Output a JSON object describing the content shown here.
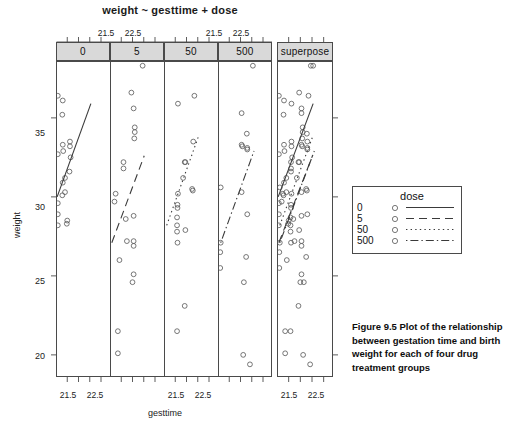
{
  "figure": {
    "title": "weight ~ gesttime + dose",
    "caption_label": "Figure 9.5",
    "caption_text": "Plot of the relationship between gestation time and birth weight for each of four drug treatment groups",
    "caption_full": "Figure 9.5   Plot of the relationship between gestation time and birth weight for each of four drug treatment groups"
  },
  "axes": {
    "x_label": "gesttime",
    "y_label": "weight",
    "x_tick_labels": [
      "21.5",
      "22.5"
    ],
    "y_tick_labels": [
      "35",
      "30",
      "25",
      "20"
    ],
    "x_ticks": [
      21.5,
      22.5
    ],
    "y_ticks": [
      20,
      25,
      30,
      35
    ],
    "xlim": [
      21.0,
      23.4
    ],
    "ylim": [
      18.6,
      38.6
    ]
  },
  "strips": {
    "panel_labels": [
      "0",
      "5",
      "50",
      "500"
    ],
    "superpose_label": "superpose"
  },
  "legend": {
    "title": "dose",
    "entries": [
      {
        "label": "0",
        "line_style": "solid",
        "symbol": "open-circle"
      },
      {
        "label": "5",
        "line_style": "dashed",
        "symbol": "open-circle"
      },
      {
        "label": "50",
        "line_style": "dotted",
        "symbol": "open-circle"
      },
      {
        "label": "500",
        "line_style": "dashdot",
        "symbol": "open-circle"
      }
    ]
  },
  "colors": {
    "point_stroke": "#555555",
    "line_stroke": "#3a3a3a",
    "frame": "#4a4a4a",
    "strip_fill": "#d9d9d9",
    "background": "#ffffff"
  },
  "chart_data": {
    "type": "scatter",
    "title": "weight ~ gesttime + dose",
    "xlabel": "gesttime",
    "ylabel": "weight",
    "xlim": [
      21.0,
      23.4
    ],
    "ylim": [
      18.6,
      38.6
    ],
    "grid": false,
    "legend_position": "right",
    "conditioning_variable": "dose",
    "panels": [
      "0",
      "5",
      "50",
      "500",
      "superpose"
    ],
    "series": [
      {
        "name": "0",
        "line_style": "solid",
        "fit_line": {
          "x0": 21.05,
          "y0": 30.0,
          "x1": 22.55,
          "y1": 35.9
        },
        "points": [
          {
            "x": 21.08,
            "y": 36.4
          },
          {
            "x": 21.3,
            "y": 36.1
          },
          {
            "x": 21.28,
            "y": 35.2
          },
          {
            "x": 21.3,
            "y": 33.3
          },
          {
            "x": 21.32,
            "y": 32.9
          },
          {
            "x": 21.08,
            "y": 32.7
          },
          {
            "x": 21.62,
            "y": 33.5
          },
          {
            "x": 21.62,
            "y": 33.2
          },
          {
            "x": 21.65,
            "y": 32.5
          },
          {
            "x": 21.6,
            "y": 31.6
          },
          {
            "x": 21.4,
            "y": 31.2
          },
          {
            "x": 21.3,
            "y": 30.9
          },
          {
            "x": 21.28,
            "y": 30.1
          },
          {
            "x": 21.4,
            "y": 30.3
          },
          {
            "x": 21.08,
            "y": 29.6
          },
          {
            "x": 21.08,
            "y": 28.9
          },
          {
            "x": 21.08,
            "y": 28.2
          },
          {
            "x": 21.5,
            "y": 28.5
          },
          {
            "x": 21.48,
            "y": 28.3
          }
        ]
      },
      {
        "name": "5",
        "line_style": "dashed",
        "fit_line": {
          "x0": 21.08,
          "y0": 27.1,
          "x1": 22.52,
          "y1": 32.6
        },
        "points": [
          {
            "x": 22.45,
            "y": 38.3
          },
          {
            "x": 21.95,
            "y": 36.6
          },
          {
            "x": 22.05,
            "y": 35.6
          },
          {
            "x": 22.1,
            "y": 34.4
          },
          {
            "x": 22.1,
            "y": 34.1
          },
          {
            "x": 22.08,
            "y": 33.7
          },
          {
            "x": 21.6,
            "y": 32.2
          },
          {
            "x": 21.6,
            "y": 31.8
          },
          {
            "x": 21.25,
            "y": 30.2
          },
          {
            "x": 21.2,
            "y": 29.7
          },
          {
            "x": 21.7,
            "y": 28.6
          },
          {
            "x": 22.05,
            "y": 28.8
          },
          {
            "x": 21.75,
            "y": 27.2
          },
          {
            "x": 22.05,
            "y": 27.2
          },
          {
            "x": 22.05,
            "y": 26.9
          },
          {
            "x": 21.42,
            "y": 26.0
          },
          {
            "x": 22.05,
            "y": 25.1
          },
          {
            "x": 22.0,
            "y": 24.6
          },
          {
            "x": 21.35,
            "y": 21.5
          },
          {
            "x": 21.35,
            "y": 20.1
          }
        ]
      },
      {
        "name": "50",
        "line_style": "dotted",
        "fit_line": {
          "x0": 21.12,
          "y0": 28.2,
          "x1": 22.55,
          "y1": 33.9
        },
        "points": [
          {
            "x": 22.35,
            "y": 36.4
          },
          {
            "x": 21.62,
            "y": 35.9
          },
          {
            "x": 22.3,
            "y": 33.5
          },
          {
            "x": 21.95,
            "y": 32.2
          },
          {
            "x": 21.92,
            "y": 32.2
          },
          {
            "x": 22.25,
            "y": 30.5
          },
          {
            "x": 22.28,
            "y": 30.4
          },
          {
            "x": 21.85,
            "y": 31.2
          },
          {
            "x": 21.62,
            "y": 30.2
          },
          {
            "x": 21.6,
            "y": 29.5
          },
          {
            "x": 21.6,
            "y": 29.3
          },
          {
            "x": 21.58,
            "y": 28.7
          },
          {
            "x": 21.58,
            "y": 28.2
          },
          {
            "x": 21.58,
            "y": 27.8
          },
          {
            "x": 21.6,
            "y": 27.1
          },
          {
            "x": 21.95,
            "y": 27.9
          },
          {
            "x": 21.92,
            "y": 23.1
          },
          {
            "x": 21.58,
            "y": 21.5
          }
        ]
      },
      {
        "name": "500",
        "line_style": "dashdot",
        "fit_line": {
          "x0": 21.12,
          "y0": 27.1,
          "x1": 22.6,
          "y1": 32.9
        },
        "points": [
          {
            "x": 22.55,
            "y": 38.3
          },
          {
            "x": 22.05,
            "y": 35.3
          },
          {
            "x": 22.28,
            "y": 34.0
          },
          {
            "x": 22.05,
            "y": 33.3
          },
          {
            "x": 22.08,
            "y": 33.2
          },
          {
            "x": 22.3,
            "y": 33.1
          },
          {
            "x": 22.3,
            "y": 33.0
          },
          {
            "x": 21.12,
            "y": 30.6
          },
          {
            "x": 22.05,
            "y": 30.3
          },
          {
            "x": 22.3,
            "y": 28.9
          },
          {
            "x": 21.12,
            "y": 27.1
          },
          {
            "x": 21.1,
            "y": 26.5
          },
          {
            "x": 22.25,
            "y": 26.2
          },
          {
            "x": 21.1,
            "y": 25.5
          },
          {
            "x": 22.15,
            "y": 24.6
          },
          {
            "x": 22.12,
            "y": 20.0
          },
          {
            "x": 22.42,
            "y": 19.4
          }
        ]
      }
    ]
  }
}
